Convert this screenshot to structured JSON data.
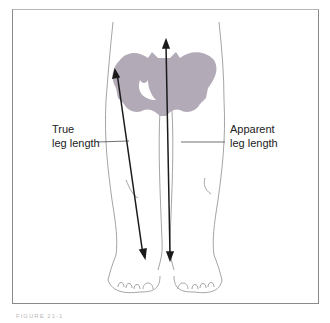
{
  "figure": {
    "labels": {
      "true_leg_length": [
        "True",
        "leg length"
      ],
      "apparent_leg_length": [
        "Apparent",
        "leg length"
      ]
    },
    "caption": "FIGURE 21-1",
    "colors": {
      "pelvis": "#b3aab8",
      "outline": "#9a9a9a",
      "arrow": "#1a1a1a",
      "frame": "#8a8a8a"
    }
  }
}
